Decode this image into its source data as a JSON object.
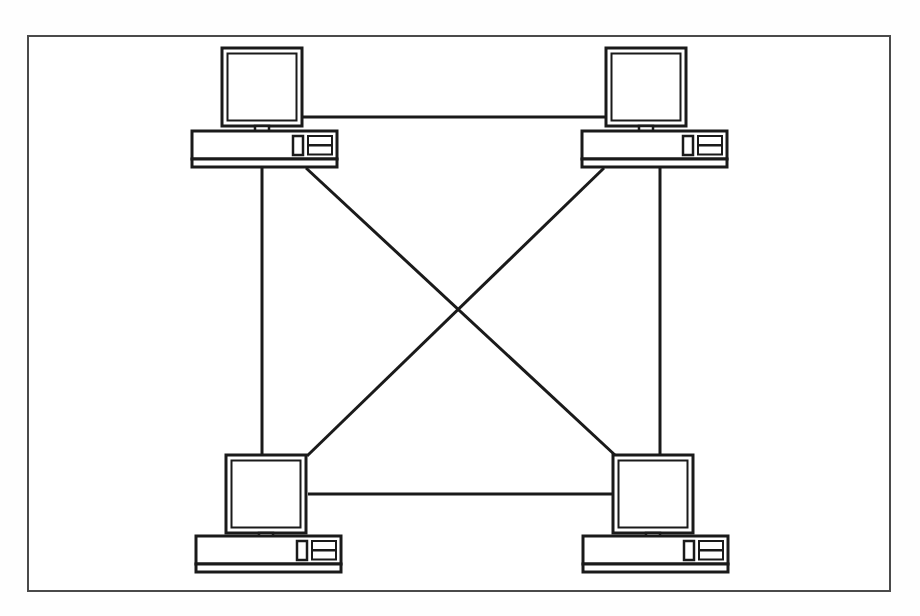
{
  "diagram": {
    "title": "Four-node peer-to-peer computer network (fully meshed)",
    "type": "network-topology",
    "canvas": {
      "width": 920,
      "height": 616
    },
    "background_color": "#fefefe",
    "stroke_color": "#1a1a1a",
    "frame": {
      "label": "diagram-border",
      "x": 27,
      "y": 35,
      "width": 864,
      "height": 557,
      "stroke_width": 2,
      "fill": "#ffffff"
    },
    "nodes": [
      {
        "id": "pc-top-left",
        "label": "Computer top-left",
        "position": "top-left",
        "monitor": {
          "x": 222,
          "y": 48,
          "width": 79,
          "height": 78
        },
        "tower": {
          "x": 192,
          "y": 131,
          "width": 145,
          "height": 36
        }
      },
      {
        "id": "pc-top-right",
        "label": "Computer top-right",
        "position": "top-right",
        "monitor": {
          "x": 606,
          "y": 48,
          "width": 79,
          "height": 78
        },
        "tower": {
          "x": 582,
          "y": 131,
          "width": 140,
          "height": 36
        }
      },
      {
        "id": "pc-bottom-left",
        "label": "Computer bottom-left",
        "position": "bottom-left",
        "monitor": {
          "x": 226,
          "y": 455,
          "width": 82,
          "height": 76
        },
        "tower": {
          "x": 196,
          "y": 536,
          "width": 145,
          "height": 36
        }
      },
      {
        "id": "pc-bottom-right",
        "label": "Computer bottom-right",
        "position": "bottom-right",
        "monitor": {
          "x": 613,
          "y": 455,
          "width": 82,
          "height": 76
        },
        "tower": {
          "x": 583,
          "y": 536,
          "width": 145,
          "height": 36
        }
      }
    ],
    "links": [
      {
        "id": "link-top",
        "label": "Top horizontal link",
        "from": "pc-top-left",
        "to": "pc-top-right",
        "x1": 301,
        "y1": 117,
        "x2": 606,
        "y2": 117
      },
      {
        "id": "link-bottom",
        "label": "Bottom horizontal link",
        "from": "pc-bottom-left",
        "to": "pc-bottom-right",
        "x1": 308,
        "y1": 494,
        "x2": 613,
        "y2": 494
      },
      {
        "id": "link-left",
        "label": "Left vertical link",
        "from": "pc-top-left",
        "to": "pc-bottom-left",
        "x1": 262,
        "y1": 167,
        "x2": 262,
        "y2": 455
      },
      {
        "id": "link-right",
        "label": "Right vertical link",
        "from": "pc-top-right",
        "to": "pc-bottom-right",
        "x1": 660,
        "y1": 167,
        "x2": 660,
        "y2": 455
      },
      {
        "id": "link-diagonal-a",
        "label": "Diagonal link top-left to bottom-right",
        "from": "pc-top-left",
        "to": "pc-bottom-right",
        "x1": 306,
        "y1": 167,
        "x2": 615,
        "y2": 455
      },
      {
        "id": "link-diagonal-b",
        "label": "Diagonal link top-right to bottom-left",
        "from": "pc-top-right",
        "to": "pc-bottom-left",
        "x1": 604,
        "y1": 167,
        "x2": 307,
        "y2": 455
      }
    ],
    "crossing_point": {
      "x": 455,
      "y": 305
    },
    "counts": {
      "nodes": 4,
      "links": 6
    }
  }
}
